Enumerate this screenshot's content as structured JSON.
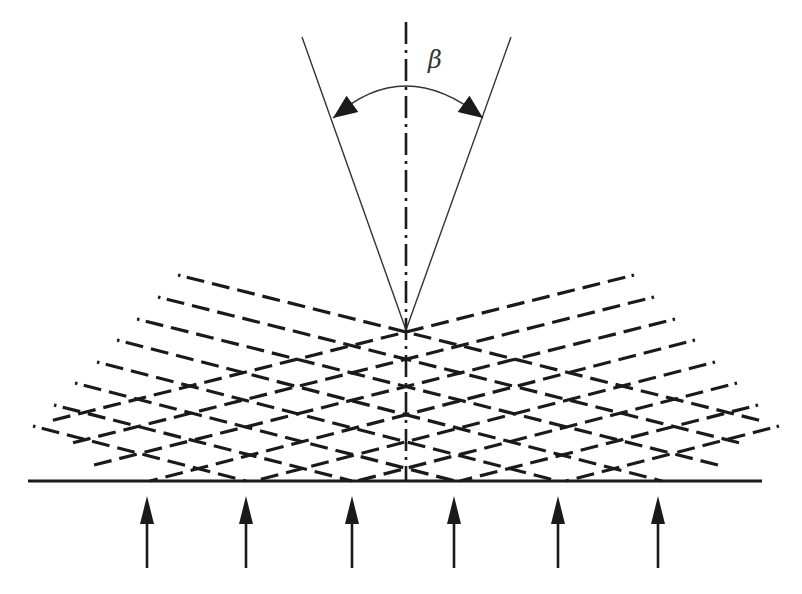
{
  "figure": {
    "angle_label": "β",
    "colors": {
      "background": "#ffffff",
      "ink": "#1a1a1a",
      "thin_line": "#333333"
    },
    "axis": {
      "x": 406,
      "y1": 22,
      "y2": 481,
      "style": "dash-dot"
    },
    "rays": [
      {
        "x1": 302,
        "y1": 37,
        "x2": 406,
        "y2": 330
      },
      {
        "x1": 511,
        "y1": 37,
        "x2": 406,
        "y2": 330
      }
    ],
    "angle_arc": {
      "start": {
        "x": 333,
        "y": 118
      },
      "apex": {
        "x": 406,
        "y": 86
      },
      "end": {
        "x": 483,
        "y": 118
      },
      "label_pos": {
        "x": 428,
        "y": 48
      }
    },
    "baseline": {
      "x1": 28,
      "y1": 481,
      "x2": 762,
      "y2": 481
    },
    "descending_wavefronts": [
      {
        "x1": 178,
        "y1": 275,
        "x2": 762,
        "y2": 421
      },
      {
        "x1": 158,
        "y1": 297,
        "x2": 740,
        "y2": 443
      },
      {
        "x1": 137,
        "y1": 319,
        "x2": 718,
        "y2": 465
      },
      {
        "x1": 117,
        "y1": 340,
        "x2": 662,
        "y2": 481
      },
      {
        "x1": 97,
        "y1": 362,
        "x2": 558,
        "y2": 481
      },
      {
        "x1": 75,
        "y1": 383,
        "x2": 455,
        "y2": 481
      },
      {
        "x1": 54,
        "y1": 405,
        "x2": 352,
        "y2": 481
      },
      {
        "x1": 33,
        "y1": 426,
        "x2": 246,
        "y2": 481
      }
    ],
    "ascending_wavefronts": [
      {
        "x1": 634,
        "y1": 275,
        "x2": 50,
        "y2": 421
      },
      {
        "x1": 654,
        "y1": 297,
        "x2": 72,
        "y2": 443
      },
      {
        "x1": 675,
        "y1": 319,
        "x2": 94,
        "y2": 465
      },
      {
        "x1": 695,
        "y1": 340,
        "x2": 150,
        "y2": 481
      },
      {
        "x1": 715,
        "y1": 362,
        "x2": 254,
        "y2": 481
      },
      {
        "x1": 737,
        "y1": 383,
        "x2": 357,
        "y2": 481
      },
      {
        "x1": 758,
        "y1": 405,
        "x2": 460,
        "y2": 481
      },
      {
        "x1": 779,
        "y1": 426,
        "x2": 566,
        "y2": 481
      }
    ],
    "incident_arrows": [
      {
        "x": 147,
        "tip_y": 496,
        "head_base_y": 524,
        "tail_y": 568
      },
      {
        "x": 246,
        "tip_y": 496,
        "head_base_y": 524,
        "tail_y": 568
      },
      {
        "x": 352,
        "tip_y": 496,
        "head_base_y": 524,
        "tail_y": 568
      },
      {
        "x": 454,
        "tip_y": 496,
        "head_base_y": 524,
        "tail_y": 568
      },
      {
        "x": 558,
        "tip_y": 496,
        "head_base_y": 524,
        "tail_y": 568
      },
      {
        "x": 658,
        "tip_y": 496,
        "head_base_y": 524,
        "tail_y": 568
      }
    ]
  }
}
